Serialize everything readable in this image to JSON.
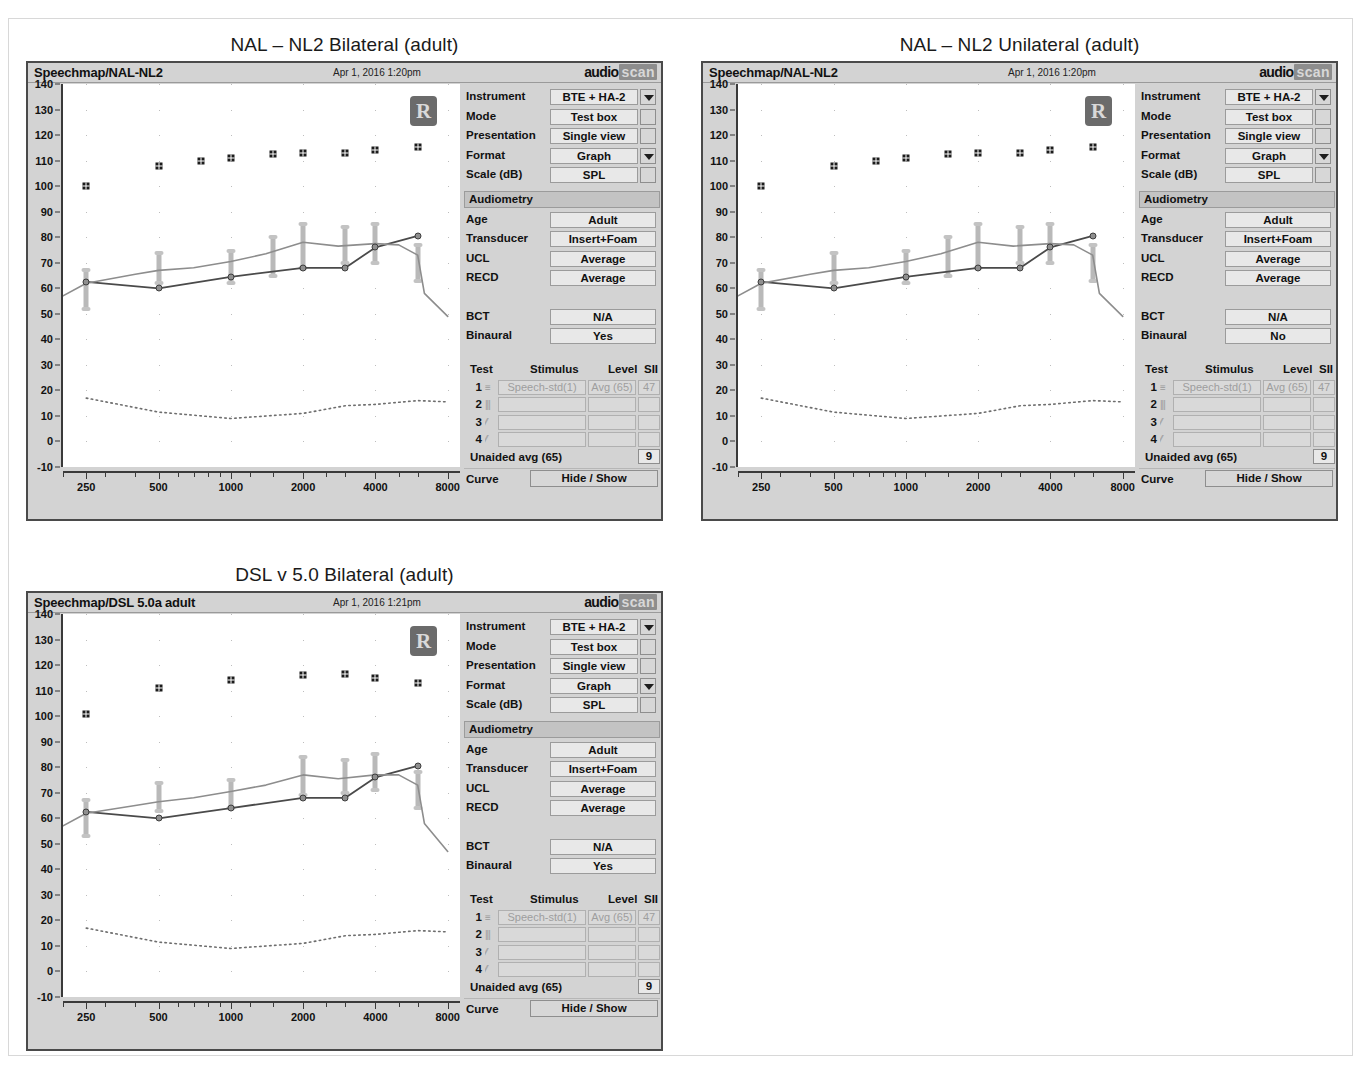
{
  "figures": [
    {
      "id": "nal-nl2-bilateral",
      "title": "NAL – NL2 Bilateral (adult)",
      "window": {
        "app_title": "Speechmap/NAL-NL2",
        "timestamp": "Apr 1, 2016 1:20pm",
        "logo_part1": "audio",
        "logo_part2": "scan",
        "ear_badge": "R"
      },
      "controls": [
        {
          "label": "Instrument",
          "value": "BTE + HA-2",
          "widget": "dropdown"
        },
        {
          "label": "Mode",
          "value": "Test box",
          "widget": "checkbox"
        },
        {
          "label": "Presentation",
          "value": "Single view",
          "widget": "checkbox"
        },
        {
          "label": "Format",
          "value": "Graph",
          "widget": "dropdown"
        },
        {
          "label": "Scale (dB)",
          "value": "SPL",
          "widget": "checkbox"
        }
      ],
      "audiometry": {
        "header": "Audiometry",
        "fields": [
          {
            "label": "Age",
            "value": "Adult"
          },
          {
            "label": "Transducer",
            "value": "Insert+Foam"
          },
          {
            "label": "UCL",
            "value": "Average"
          },
          {
            "label": "RECD",
            "value": "Average"
          },
          {
            "label": "BCT",
            "value": "N/A"
          },
          {
            "label": "Binaural",
            "value": "Yes"
          }
        ]
      },
      "test_table": {
        "headers": [
          "Test",
          "Stimulus",
          "Level",
          "SII"
        ],
        "rows": [
          {
            "num": "1",
            "glyph": "≡",
            "stimulus": "Speech-std(1)",
            "level": "Avg (65)",
            "sii": "47"
          },
          {
            "num": "2",
            "glyph": "|||",
            "stimulus": "",
            "level": "",
            "sii": ""
          },
          {
            "num": "3",
            "glyph": "⁄⁄",
            "stimulus": "",
            "level": "",
            "sii": ""
          },
          {
            "num": "4",
            "glyph": "⁄⁄",
            "stimulus": "",
            "level": "",
            "sii": ""
          }
        ],
        "unaided_label": "Unaided avg (65)",
        "unaided_value": "9",
        "curve_label": "Curve",
        "curve_button": "Hide / Show"
      },
      "chart_data": {
        "type": "line",
        "title": "NAL – NL2 Bilateral (adult)",
        "xlabel": "",
        "ylabel": "dB SPL",
        "xlim": [
          200,
          9000
        ],
        "ylim": [
          -10,
          140
        ],
        "xscale": "log",
        "xticks": [
          250,
          500,
          1000,
          2000,
          4000,
          8000
        ],
        "yticks": [
          -10,
          0,
          10,
          20,
          30,
          40,
          50,
          60,
          70,
          80,
          90,
          100,
          110,
          120,
          130,
          140
        ],
        "grid": "dots",
        "series": [
          {
            "name": "UCL",
            "marker": "asterisk",
            "x": [
              250,
              500,
              750,
              1000,
              1500,
              2000,
              3000,
              4000,
              6000
            ],
            "y": [
              100,
              108,
              110,
              111,
              112.5,
              113,
              113,
              114,
              115.5
            ]
          },
          {
            "name": "Aided speech (dark)",
            "marker": "circle",
            "x": [
              250,
              500,
              1000,
              2000,
              3000,
              4000,
              6000
            ],
            "y": [
              62.5,
              60,
              64.5,
              68,
              68,
              76,
              80.5
            ]
          },
          {
            "name": "Target / REAR (light)",
            "marker": "line",
            "x": [
              200,
              250,
              400,
              500,
              700,
              1000,
              1400,
              2000,
              2800,
              4000,
              5000,
              6000,
              6400,
              8000
            ],
            "y": [
              57,
              62,
              65.5,
              67,
              68,
              70.5,
              73.5,
              78,
              76.5,
              77.5,
              77,
              73,
              58,
              49
            ]
          },
          {
            "name": "Thresholds (dotted)",
            "marker": "dotted",
            "x": [
              250,
              500,
              1000,
              2000,
              3000,
              4000,
              6000,
              8000
            ],
            "y": [
              17,
              11.5,
              9,
              11,
              14,
              14.5,
              16,
              15.5
            ]
          }
        ],
        "speech_bars": {
          "x": [
            250,
            500,
            1000,
            1500,
            2000,
            3000,
            4000,
            6000
          ],
          "top": [
            67,
            74,
            74.5,
            80,
            85,
            84,
            85,
            77
          ],
          "bottom": [
            52,
            62,
            62,
            65,
            68,
            70,
            70,
            63
          ]
        }
      }
    },
    {
      "id": "nal-nl2-unilateral",
      "title": "NAL – NL2 Unilateral (adult)",
      "window": {
        "app_title": "Speechmap/NAL-NL2",
        "timestamp": "Apr 1, 2016 1:20pm",
        "logo_part1": "audio",
        "logo_part2": "scan",
        "ear_badge": "R"
      },
      "controls": [
        {
          "label": "Instrument",
          "value": "BTE + HA-2",
          "widget": "dropdown"
        },
        {
          "label": "Mode",
          "value": "Test box",
          "widget": "checkbox"
        },
        {
          "label": "Presentation",
          "value": "Single view",
          "widget": "checkbox"
        },
        {
          "label": "Format",
          "value": "Graph",
          "widget": "dropdown"
        },
        {
          "label": "Scale (dB)",
          "value": "SPL",
          "widget": "checkbox"
        }
      ],
      "audiometry": {
        "header": "Audiometry",
        "fields": [
          {
            "label": "Age",
            "value": "Adult"
          },
          {
            "label": "Transducer",
            "value": "Insert+Foam"
          },
          {
            "label": "UCL",
            "value": "Average"
          },
          {
            "label": "RECD",
            "value": "Average"
          },
          {
            "label": "BCT",
            "value": "N/A"
          },
          {
            "label": "Binaural",
            "value": "No"
          }
        ]
      },
      "test_table": {
        "headers": [
          "Test",
          "Stimulus",
          "Level",
          "SII"
        ],
        "rows": [
          {
            "num": "1",
            "glyph": "≡",
            "stimulus": "Speech-std(1)",
            "level": "Avg (65)",
            "sii": "47"
          },
          {
            "num": "2",
            "glyph": "|||",
            "stimulus": "",
            "level": "",
            "sii": ""
          },
          {
            "num": "3",
            "glyph": "⁄⁄",
            "stimulus": "",
            "level": "",
            "sii": ""
          },
          {
            "num": "4",
            "glyph": "⁄⁄",
            "stimulus": "",
            "level": "",
            "sii": ""
          }
        ],
        "unaided_label": "Unaided avg (65)",
        "unaided_value": "9",
        "curve_label": "Curve",
        "curve_button": "Hide / Show"
      },
      "chart_data": {
        "type": "line",
        "title": "NAL – NL2 Unilateral (adult)",
        "xlabel": "",
        "ylabel": "dB SPL",
        "xlim": [
          200,
          9000
        ],
        "ylim": [
          -10,
          140
        ],
        "xscale": "log",
        "xticks": [
          250,
          500,
          1000,
          2000,
          4000,
          8000
        ],
        "yticks": [
          -10,
          0,
          10,
          20,
          30,
          40,
          50,
          60,
          70,
          80,
          90,
          100,
          110,
          120,
          130,
          140
        ],
        "grid": "dots",
        "series": [
          {
            "name": "UCL",
            "marker": "asterisk",
            "x": [
              250,
              500,
              750,
              1000,
              1500,
              2000,
              3000,
              4000,
              6000
            ],
            "y": [
              100,
              108,
              110,
              111,
              112.5,
              113,
              113,
              114,
              115.5
            ]
          },
          {
            "name": "Aided speech (dark)",
            "marker": "circle",
            "x": [
              250,
              500,
              1000,
              2000,
              3000,
              4000,
              6000
            ],
            "y": [
              62.5,
              60,
              64.5,
              68,
              68,
              76,
              80.5
            ]
          },
          {
            "name": "Target / REAR (light)",
            "marker": "line",
            "x": [
              200,
              250,
              400,
              500,
              700,
              1000,
              1400,
              2000,
              2800,
              4000,
              5000,
              6000,
              6400,
              8000
            ],
            "y": [
              57,
              62,
              65.5,
              67,
              68,
              70.5,
              73.5,
              78,
              76.5,
              77.5,
              77,
              73,
              58,
              49
            ]
          },
          {
            "name": "Thresholds (dotted)",
            "marker": "dotted",
            "x": [
              250,
              500,
              1000,
              2000,
              3000,
              4000,
              6000,
              8000
            ],
            "y": [
              17,
              11.5,
              9,
              11,
              14,
              14.5,
              16,
              15.5
            ]
          }
        ],
        "speech_bars": {
          "x": [
            250,
            500,
            1000,
            1500,
            2000,
            3000,
            4000,
            6000
          ],
          "top": [
            67,
            74,
            74.5,
            80,
            85,
            84,
            85,
            77
          ],
          "bottom": [
            52,
            62,
            62,
            65,
            68,
            70,
            70,
            63
          ]
        }
      }
    },
    {
      "id": "dsl-v5-bilateral",
      "title": "DSL v 5.0 Bilateral (adult)",
      "window": {
        "app_title": "Speechmap/DSL 5.0a adult",
        "timestamp": "Apr 1, 2016 1:21pm",
        "logo_part1": "audio",
        "logo_part2": "scan",
        "ear_badge": "R"
      },
      "controls": [
        {
          "label": "Instrument",
          "value": "BTE + HA-2",
          "widget": "dropdown"
        },
        {
          "label": "Mode",
          "value": "Test box",
          "widget": "checkbox"
        },
        {
          "label": "Presentation",
          "value": "Single view",
          "widget": "checkbox"
        },
        {
          "label": "Format",
          "value": "Graph",
          "widget": "dropdown"
        },
        {
          "label": "Scale (dB)",
          "value": "SPL",
          "widget": "checkbox"
        }
      ],
      "audiometry": {
        "header": "Audiometry",
        "fields": [
          {
            "label": "Age",
            "value": "Adult"
          },
          {
            "label": "Transducer",
            "value": "Insert+Foam"
          },
          {
            "label": "UCL",
            "value": "Average"
          },
          {
            "label": "RECD",
            "value": "Average"
          },
          {
            "label": "BCT",
            "value": "N/A"
          },
          {
            "label": "Binaural",
            "value": "Yes"
          }
        ]
      },
      "test_table": {
        "headers": [
          "Test",
          "Stimulus",
          "Level",
          "SII"
        ],
        "rows": [
          {
            "num": "1",
            "glyph": "≡",
            "stimulus": "Speech-std(1)",
            "level": "Avg (65)",
            "sii": "47"
          },
          {
            "num": "2",
            "glyph": "|||",
            "stimulus": "",
            "level": "",
            "sii": ""
          },
          {
            "num": "3",
            "glyph": "⁄⁄",
            "stimulus": "",
            "level": "",
            "sii": ""
          },
          {
            "num": "4",
            "glyph": "⁄⁄",
            "stimulus": "",
            "level": "",
            "sii": ""
          }
        ],
        "unaided_label": "Unaided avg (65)",
        "unaided_value": "9",
        "curve_label": "Curve",
        "curve_button": "Hide / Show"
      },
      "chart_data": {
        "type": "line",
        "title": "DSL v 5.0 Bilateral (adult)",
        "xlabel": "",
        "ylabel": "dB SPL",
        "xlim": [
          200,
          9000
        ],
        "ylim": [
          -10,
          140
        ],
        "xscale": "log",
        "xticks": [
          250,
          500,
          1000,
          2000,
          4000,
          8000
        ],
        "yticks": [
          -10,
          0,
          10,
          20,
          30,
          40,
          50,
          60,
          70,
          80,
          90,
          100,
          110,
          120,
          130,
          140
        ],
        "grid": "dots",
        "series": [
          {
            "name": "UCL",
            "marker": "asterisk",
            "x": [
              250,
              500,
              1000,
              2000,
              3000,
              4000,
              6000
            ],
            "y": [
              101,
              111,
              114,
              116,
              116.5,
              115,
              113
            ]
          },
          {
            "name": "Aided speech (dark)",
            "marker": "circle",
            "x": [
              250,
              500,
              1000,
              2000,
              3000,
              4000,
              6000
            ],
            "y": [
              62.5,
              60,
              64,
              68,
              68,
              76,
              80.5
            ]
          },
          {
            "name": "Target / REAR (light)",
            "marker": "line",
            "x": [
              200,
              250,
              400,
              500,
              700,
              1000,
              1400,
              2000,
              2800,
              4000,
              5000,
              6000,
              6400,
              8000
            ],
            "y": [
              57,
              62,
              65,
              66.5,
              68,
              70.5,
              73,
              77,
              75.5,
              77,
              77,
              73,
              58,
              47
            ]
          },
          {
            "name": "Thresholds (dotted)",
            "marker": "dotted",
            "x": [
              250,
              500,
              1000,
              2000,
              3000,
              4000,
              6000,
              8000
            ],
            "y": [
              17,
              11.5,
              9,
              11,
              14,
              14.5,
              16,
              15.5
            ]
          }
        ],
        "speech_bars": {
          "x": [
            250,
            500,
            1000,
            2000,
            3000,
            4000,
            6000
          ],
          "top": [
            67,
            74,
            75,
            84,
            83,
            85,
            78
          ],
          "bottom": [
            53,
            63,
            64,
            69,
            70,
            71,
            64
          ]
        }
      }
    }
  ]
}
